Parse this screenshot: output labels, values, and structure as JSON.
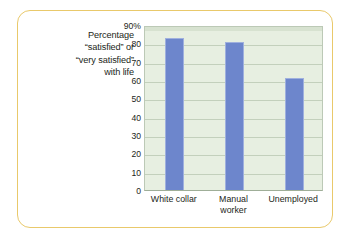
{
  "figure": {
    "caption_lines": [
      "Percentage",
      "“satisfied” or",
      "“very satisfied”",
      "with life"
    ],
    "border_color": "#e9c96b"
  },
  "chart_data": {
    "type": "bar",
    "title": "",
    "subtitle": "",
    "xlabel": "",
    "ylabel": "Percentage “satisfied” or “very satisfied” with life",
    "categories": [
      "White collar",
      "Manual worker",
      "Unemployed"
    ],
    "category_lines": [
      [
        "White collar"
      ],
      [
        "Manual",
        "worker"
      ],
      [
        "Unemployed"
      ]
    ],
    "values": [
      83,
      81,
      61
    ],
    "ylim": [
      0,
      90
    ],
    "yticks": [
      0,
      10,
      20,
      30,
      40,
      50,
      60,
      70,
      80,
      90
    ],
    "ytick_labels": [
      "0",
      "10",
      "20",
      "30",
      "40",
      "50",
      "60",
      "70",
      "80",
      "90%"
    ],
    "grid": true,
    "legend": null,
    "bar_color": "#6d86cc",
    "plot_background": "#e7efe1",
    "gridline_color": "#c3d0bc"
  }
}
